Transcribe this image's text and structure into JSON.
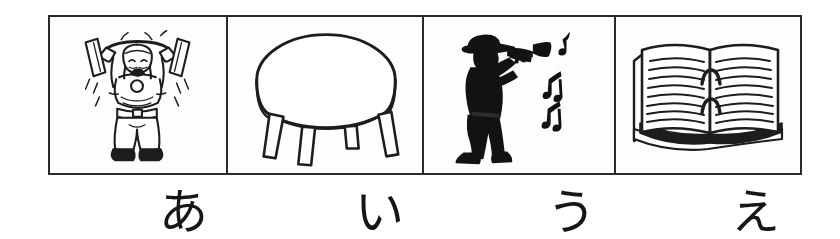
{
  "worksheet": {
    "title": "Hiragana picture-word worksheet",
    "background_color": "#ffffff",
    "ink_color": "#2b2b2b",
    "border_color": "#2b2b2b"
  },
  "strip": {
    "cells": [
      {
        "index": 1,
        "kana": "あ",
        "romaji": "a",
        "picture_name": "weightlifter-illustration",
        "picture_description": "Cartoon man straining while lifting a barbell overhead",
        "style": "line-drawing"
      },
      {
        "index": 2,
        "kana": "い",
        "romaji": "i",
        "picture_name": "round-stool-illustration",
        "picture_description": "Round four-legged stool / small table seen from above-front",
        "style": "line-drawing"
      },
      {
        "index": 3,
        "kana": "う",
        "romaji": "u",
        "picture_name": "trumpet-player-illustration",
        "picture_description": "Black silhouette of a hat-wearing man playing a trumpet with music notes",
        "style": "silhouette"
      },
      {
        "index": 4,
        "kana": "え",
        "romaji": "e",
        "picture_name": "open-book-illustration",
        "picture_description": "Open book with ruled lines of text on both pages",
        "style": "line-drawing"
      }
    ]
  }
}
